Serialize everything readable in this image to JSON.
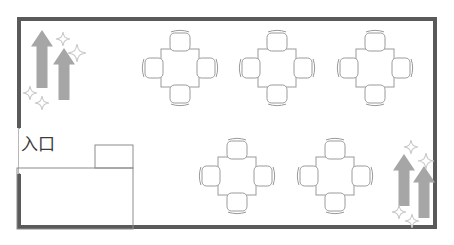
{
  "plan": {
    "title": "店舗フロアプラン",
    "entrance_label": "入口",
    "colors": {
      "wall": "#5a5a5a",
      "furniture_outline": "#9a9a9a",
      "counter_outline": "#8c8c8c",
      "arrow": "#a6a6a6",
      "sparkle": "#c9c9c9",
      "text": "#3b3b3b",
      "background": "#ffffff"
    },
    "room": {
      "x": 17,
      "y": 17,
      "width": 420,
      "height": 212,
      "wall_thickness": 4
    },
    "entrance_gap": {
      "side": "left",
      "y_start": 128,
      "y_end": 174
    },
    "counter": {
      "name": "reception-counter",
      "main": {
        "x": 17,
        "y": 168,
        "width": 116,
        "height": 61
      },
      "notch": {
        "x": 95,
        "y": 145,
        "width": 38,
        "height": 23
      }
    },
    "table_size": 38,
    "chair": {
      "width": 20,
      "height": 18,
      "offset": 26
    },
    "table_groups": [
      {
        "id": "table-1",
        "seats": 4,
        "cx": 180,
        "cy": 68,
        "row": "top"
      },
      {
        "id": "table-2",
        "seats": 4,
        "cx": 277,
        "cy": 68,
        "row": "top"
      },
      {
        "id": "table-3",
        "seats": 4,
        "cx": 375,
        "cy": 68,
        "row": "top"
      },
      {
        "id": "table-4",
        "seats": 4,
        "cx": 237,
        "cy": 176,
        "row": "bottom"
      },
      {
        "id": "table-5",
        "seats": 4,
        "cx": 335,
        "cy": 176,
        "row": "bottom"
      }
    ],
    "arrows": [
      {
        "id": "arrow-tl-1",
        "x": 42,
        "y": 30,
        "length": 58,
        "width": 11,
        "direction": "up"
      },
      {
        "id": "arrow-tl-2",
        "x": 64,
        "y": 48,
        "length": 52,
        "width": 11,
        "direction": "up"
      },
      {
        "id": "arrow-br-1",
        "x": 404,
        "y": 154,
        "length": 52,
        "width": 11,
        "direction": "up"
      },
      {
        "id": "arrow-br-2",
        "x": 424,
        "y": 166,
        "length": 52,
        "width": 11,
        "direction": "up"
      }
    ],
    "sparkles": [
      {
        "id": "sparkle-tl-1",
        "cx": 63,
        "cy": 39,
        "r": 7
      },
      {
        "id": "sparkle-tl-2",
        "cx": 77,
        "cy": 53,
        "r": 9
      },
      {
        "id": "sparkle-tl-3",
        "cx": 30,
        "cy": 93,
        "r": 7
      },
      {
        "id": "sparkle-tl-4",
        "cx": 42,
        "cy": 103,
        "r": 7
      },
      {
        "id": "sparkle-br-1",
        "cx": 411,
        "cy": 147,
        "r": 7
      },
      {
        "id": "sparkle-br-2",
        "cx": 426,
        "cy": 161,
        "r": 8
      },
      {
        "id": "sparkle-br-3",
        "cx": 399,
        "cy": 212,
        "r": 7
      },
      {
        "id": "sparkle-br-4",
        "cx": 412,
        "cy": 221,
        "r": 7
      }
    ],
    "legend": {
      "seat_total": "20",
      "table_total": "5"
    }
  }
}
